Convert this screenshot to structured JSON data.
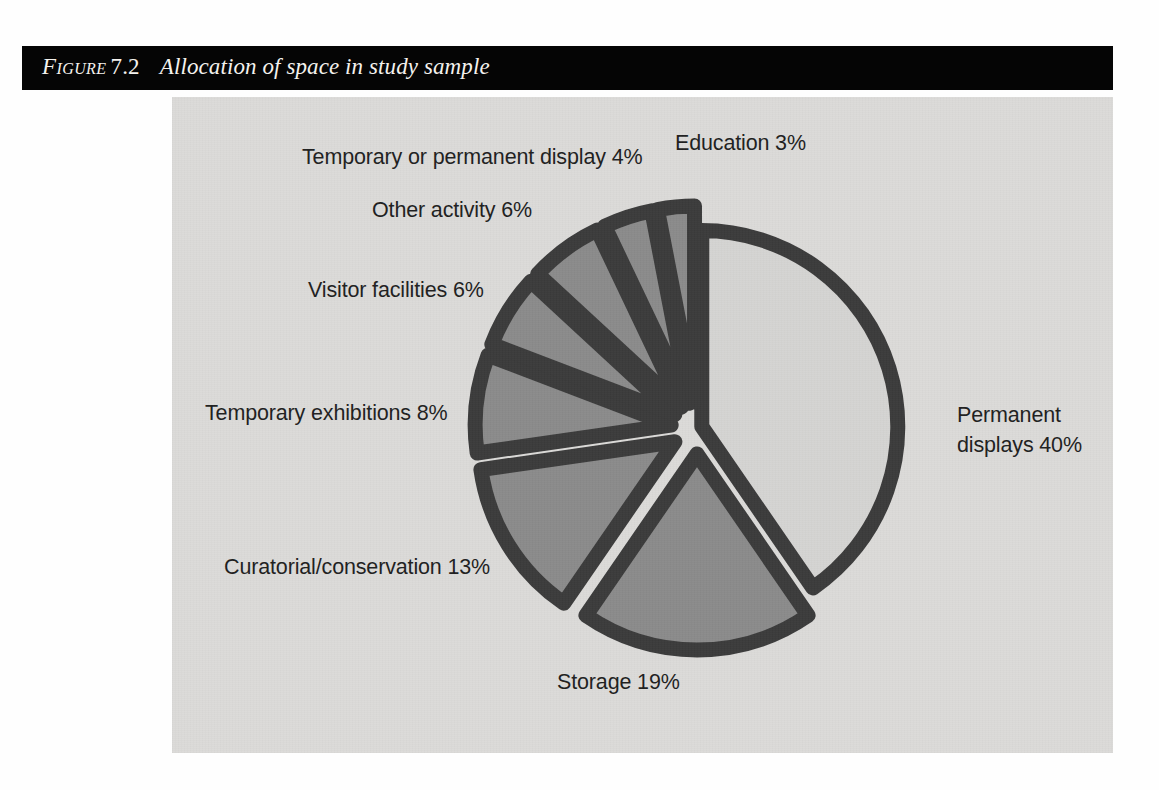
{
  "caption": {
    "figure_word": "Figure",
    "figure_number": "7.2",
    "title": "Allocation of space in study sample"
  },
  "colors": {
    "caption_bar": "#050505",
    "caption_text": "#f4f2ee",
    "panel_background": "#dcdbd9",
    "slice_fill": "#8b8b8b",
    "slice_fill_large": "#d5d4d2",
    "slice_stroke": "#3b3b3b",
    "label_text": "#1e1e1e",
    "page_background": "#fefefe"
  },
  "labels": {
    "education": "Education 3%",
    "temporary_or_permanent_display": "Temporary or permanent display 4%",
    "other_activity": "Other activity 6%",
    "visitor_facilities": "Visitor facilities 6%",
    "temporary_exhibitions": "Temporary exhibitions 8%",
    "curatorial_conservation": "Curatorial/conservation 13%",
    "storage": "Storage 19%",
    "permanent_displays_line1": "Permanent",
    "permanent_displays_line2": "displays 40%"
  },
  "chart_data": {
    "type": "pie",
    "title": "Allocation of space in study sample",
    "subtitle": "",
    "xlabel": "",
    "ylabel": "",
    "units": "percent",
    "total": 99,
    "exploded": true,
    "start_angle_deg": 0,
    "direction": "clockwise",
    "legend_position": "none (direct labels)",
    "grid": false,
    "categories": [
      "Permanent displays",
      "Storage",
      "Curatorial/conservation",
      "Temporary exhibitions",
      "Visitor facilities",
      "Other activity",
      "Temporary or permanent display",
      "Education"
    ],
    "values": [
      40,
      19,
      13,
      8,
      6,
      6,
      4,
      3
    ],
    "slices": [
      {
        "label": "Permanent displays",
        "value": 40,
        "display": "Permanent displays 40%",
        "fill": "#d5d4d2",
        "stroke": "#3b3b3b"
      },
      {
        "label": "Storage",
        "value": 19,
        "display": "Storage 19%",
        "fill": "#8b8b8b",
        "stroke": "#3b3b3b"
      },
      {
        "label": "Curatorial/conservation",
        "value": 13,
        "display": "Curatorial/conservation 13%",
        "fill": "#8b8b8b",
        "stroke": "#3b3b3b"
      },
      {
        "label": "Temporary exhibitions",
        "value": 8,
        "display": "Temporary exhibitions 8%",
        "fill": "#8b8b8b",
        "stroke": "#3b3b3b"
      },
      {
        "label": "Visitor facilities",
        "value": 6,
        "display": "Visitor facilities 6%",
        "fill": "#8b8b8b",
        "stroke": "#3b3b3b"
      },
      {
        "label": "Other activity",
        "value": 6,
        "display": "Other activity 6%",
        "fill": "#8b8b8b",
        "stroke": "#3b3b3b"
      },
      {
        "label": "Temporary or permanent display",
        "value": 4,
        "display": "Temporary or permanent display 4%",
        "fill": "#8b8b8b",
        "stroke": "#3b3b3b"
      },
      {
        "label": "Education",
        "value": 3,
        "display": "Education 3%",
        "fill": "#8b8b8b",
        "stroke": "#3b3b3b"
      }
    ]
  }
}
